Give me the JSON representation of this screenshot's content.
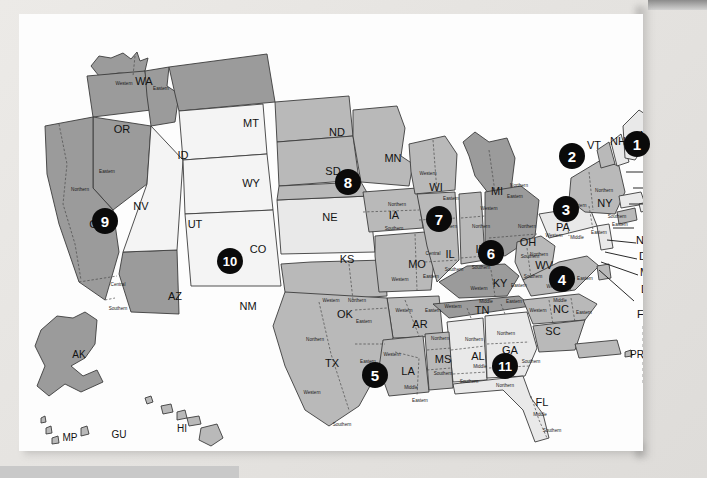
{
  "document": {
    "type": "map",
    "title": "United States Federal Judicial Circuits and District Courts Map",
    "background_color": "#e8e8e6",
    "paper_color": "#fdfdfd"
  },
  "legend_colors": {
    "circuit_dark": "#9b9b9b",
    "circuit_mid": "#b9b9b9",
    "circuit_light": "#e9e9e9",
    "circuit_white": "#f4f4f4",
    "badge_fill": "#0a0a0a",
    "badge_text": "#ffffff",
    "outline": "#3c3c3c"
  },
  "circuits": [
    {
      "number": "1",
      "x": 637,
      "y": 144,
      "size": 26
    },
    {
      "number": "2",
      "x": 572,
      "y": 156,
      "size": 26
    },
    {
      "number": "3",
      "x": 566,
      "y": 209,
      "size": 26
    },
    {
      "number": "4",
      "x": 562,
      "y": 279,
      "size": 26
    },
    {
      "number": "5",
      "x": 375,
      "y": 375,
      "size": 26
    },
    {
      "number": "6",
      "x": 491,
      "y": 253,
      "size": 26
    },
    {
      "number": "7",
      "x": 439,
      "y": 219,
      "size": 26
    },
    {
      "number": "8",
      "x": 348,
      "y": 182,
      "size": 26
    },
    {
      "number": "9",
      "x": 105,
      "y": 221,
      "size": 26
    },
    {
      "number": "10",
      "x": 230,
      "y": 261,
      "size": 26
    },
    {
      "number": "11",
      "x": 505,
      "y": 366,
      "size": 26
    }
  ],
  "states": [
    {
      "code": "WA",
      "x": 125,
      "y": 68,
      "group": "circuit9"
    },
    {
      "code": "OR",
      "x": 103,
      "y": 116,
      "group": "circuit9"
    },
    {
      "code": "ID",
      "x": 164,
      "y": 142,
      "group": "circuit9"
    },
    {
      "code": "MT",
      "x": 232,
      "y": 110,
      "group": "circuit9"
    },
    {
      "code": "ND",
      "x": 318,
      "y": 119,
      "group": "circuit8"
    },
    {
      "code": "SD",
      "x": 314,
      "y": 158,
      "group": "circuit8"
    },
    {
      "code": "NE",
      "x": 311,
      "y": 204,
      "group": "circuit8"
    },
    {
      "code": "MN",
      "x": 374,
      "y": 145,
      "group": "circuit8"
    },
    {
      "code": "WY",
      "x": 232,
      "y": 170,
      "group": "circuit10"
    },
    {
      "code": "NV",
      "x": 122,
      "y": 193,
      "group": "circuit9"
    },
    {
      "code": "CA",
      "x": 78,
      "y": 211,
      "group": "circuit9"
    },
    {
      "code": "UT",
      "x": 176,
      "y": 211,
      "group": "circuit10"
    },
    {
      "code": "CO",
      "x": 239,
      "y": 236,
      "group": "circuit10"
    },
    {
      "code": "KS",
      "x": 328,
      "y": 246,
      "group": "circuit10"
    },
    {
      "code": "AZ",
      "x": 156,
      "y": 283,
      "group": "circuit9"
    },
    {
      "code": "NM",
      "x": 229,
      "y": 293,
      "group": "circuit10"
    },
    {
      "code": "OK",
      "x": 326,
      "y": 301,
      "group": "circuit10"
    },
    {
      "code": "TX",
      "x": 313,
      "y": 350,
      "group": "circuit5"
    },
    {
      "code": "IA",
      "x": 375,
      "y": 202,
      "group": "circuit8"
    },
    {
      "code": "MO",
      "x": 398,
      "y": 251,
      "group": "circuit8"
    },
    {
      "code": "AR",
      "x": 401,
      "y": 311,
      "group": "circuit8"
    },
    {
      "code": "LA",
      "x": 389,
      "y": 358,
      "group": "circuit5"
    },
    {
      "code": "MS",
      "x": 424,
      "y": 346,
      "group": "circuit5"
    },
    {
      "code": "WI",
      "x": 417,
      "y": 174,
      "group": "circuit7"
    },
    {
      "code": "IL",
      "x": 431,
      "y": 241,
      "group": "circuit7"
    },
    {
      "code": "IN",
      "x": 462,
      "y": 236,
      "group": "circuit7"
    },
    {
      "code": "MI",
      "x": 478,
      "y": 178,
      "group": "circuit6"
    },
    {
      "code": "OH",
      "x": 509,
      "y": 229,
      "group": "circuit6"
    },
    {
      "code": "KY",
      "x": 481,
      "y": 270,
      "group": "circuit6"
    },
    {
      "code": "TN",
      "x": 463,
      "y": 297,
      "group": "circuit6"
    },
    {
      "code": "AL",
      "x": 459,
      "y": 343,
      "group": "circuit11"
    },
    {
      "code": "GA",
      "x": 491,
      "y": 337,
      "group": "circuit11"
    },
    {
      "code": "FL",
      "x": 523,
      "y": 389,
      "group": "circuit11"
    },
    {
      "code": "SC",
      "x": 534,
      "y": 318,
      "group": "circuit4"
    },
    {
      "code": "NC",
      "x": 542,
      "y": 296,
      "group": "circuit4"
    },
    {
      "code": "VA",
      "x": 549,
      "y": 262,
      "group": "circuit4"
    },
    {
      "code": "WV",
      "x": 525,
      "y": 252,
      "group": "circuit4"
    },
    {
      "code": "PA",
      "x": 544,
      "y": 214,
      "group": "circuit3"
    },
    {
      "code": "NY",
      "x": 586,
      "y": 190,
      "group": "circuit2"
    },
    {
      "code": "VT",
      "x": 575,
      "y": 132,
      "group": "circuit2"
    },
    {
      "code": "NH",
      "x": 599,
      "y": 128,
      "group": "circuit1"
    },
    {
      "code": "ME",
      "x": 629,
      "y": 122,
      "group": "circuit1"
    }
  ],
  "callout_labels": [
    {
      "code": "MA",
      "x": 626,
      "y": 172
    },
    {
      "code": "RI",
      "x": 633,
      "y": 188
    },
    {
      "code": "CT",
      "x": 633,
      "y": 205
    },
    {
      "code": "NJ",
      "x": 617,
      "y": 227
    },
    {
      "code": "DE",
      "x": 620,
      "y": 243
    },
    {
      "code": "MD",
      "x": 621,
      "y": 259
    },
    {
      "code": "DC",
      "x": 622,
      "y": 276
    },
    {
      "code": "FED",
      "x": 618,
      "y": 301
    }
  ],
  "territories": [
    {
      "code": "AK",
      "x": 60,
      "y": 341
    },
    {
      "code": "HI",
      "x": 163,
      "y": 415
    },
    {
      "code": "MP",
      "x": 51,
      "y": 424
    },
    {
      "code": "GU",
      "x": 100,
      "y": 421
    },
    {
      "code": "PR",
      "x": 618,
      "y": 341
    },
    {
      "code": "VI",
      "x": 674,
      "y": 356
    }
  ],
  "district_divisions": [
    {
      "name": "Western",
      "state": "WA",
      "x": 105,
      "y": 70
    },
    {
      "name": "Eastern",
      "state": "WA",
      "x": 142,
      "y": 75
    },
    {
      "name": "Eastern",
      "state": "CA",
      "x": 88,
      "y": 158
    },
    {
      "name": "Northern",
      "state": "CA",
      "x": 61,
      "y": 176
    },
    {
      "name": "Central",
      "state": "CA",
      "x": 99,
      "y": 271
    },
    {
      "name": "Southern",
      "state": "CA",
      "x": 99,
      "y": 295
    },
    {
      "name": "Northern",
      "state": "IA",
      "x": 378,
      "y": 191
    },
    {
      "name": "Southern",
      "state": "IA",
      "x": 375,
      "y": 215
    },
    {
      "name": "Western",
      "state": "WI",
      "x": 409,
      "y": 160
    },
    {
      "name": "Eastern",
      "state": "WI",
      "x": 432,
      "y": 185
    },
    {
      "name": "Western",
      "state": "MI",
      "x": 470,
      "y": 195
    },
    {
      "name": "Eastern",
      "state": "MI",
      "x": 496,
      "y": 183
    },
    {
      "name": "Northern",
      "state": "IL",
      "x": 429,
      "y": 213
    },
    {
      "name": "Central",
      "state": "IL",
      "x": 414,
      "y": 240
    },
    {
      "name": "Southern",
      "state": "IL",
      "x": 435,
      "y": 256
    },
    {
      "name": "Northern",
      "state": "IN",
      "x": 462,
      "y": 213
    },
    {
      "name": "Southern",
      "state": "IN",
      "x": 462,
      "y": 254
    },
    {
      "name": "Northern",
      "state": "OH",
      "x": 508,
      "y": 213
    },
    {
      "name": "Southern",
      "state": "OH",
      "x": 511,
      "y": 243
    },
    {
      "name": "Western",
      "state": "MO",
      "x": 381,
      "y": 266
    },
    {
      "name": "Eastern",
      "state": "MO",
      "x": 412,
      "y": 263
    },
    {
      "name": "Western",
      "state": "AR",
      "x": 385,
      "y": 297
    },
    {
      "name": "Eastern",
      "state": "AR",
      "x": 414,
      "y": 297
    },
    {
      "name": "Western",
      "state": "OK",
      "x": 312,
      "y": 287
    },
    {
      "name": "Northern",
      "state": "OK",
      "x": 338,
      "y": 287
    },
    {
      "name": "Eastern",
      "state": "OK",
      "x": 345,
      "y": 308
    },
    {
      "name": "Northern",
      "state": "TX",
      "x": 296,
      "y": 326
    },
    {
      "name": "Eastern",
      "state": "TX",
      "x": 349,
      "y": 348
    },
    {
      "name": "Western",
      "state": "TX",
      "x": 293,
      "y": 379
    },
    {
      "name": "Southern",
      "state": "TX",
      "x": 323,
      "y": 411
    },
    {
      "name": "Western",
      "state": "LA",
      "x": 373,
      "y": 341
    },
    {
      "name": "Middle",
      "state": "LA",
      "x": 392,
      "y": 374
    },
    {
      "name": "Eastern",
      "state": "LA",
      "x": 401,
      "y": 387
    },
    {
      "name": "Northern",
      "state": "MS",
      "x": 421,
      "y": 325
    },
    {
      "name": "Southern",
      "state": "MS",
      "x": 424,
      "y": 360
    },
    {
      "name": "Northern",
      "state": "AL",
      "x": 455,
      "y": 326
    },
    {
      "name": "Middle",
      "state": "AL",
      "x": 461,
      "y": 353
    },
    {
      "name": "Southern",
      "state": "AL",
      "x": 450,
      "y": 368
    },
    {
      "name": "Northern",
      "state": "GA",
      "x": 487,
      "y": 320
    },
    {
      "name": "Middle",
      "state": "GA",
      "x": 485,
      "y": 347
    },
    {
      "name": "Southern",
      "state": "GA",
      "x": 512,
      "y": 348
    },
    {
      "name": "Northern",
      "state": "FL",
      "x": 486,
      "y": 372
    },
    {
      "name": "Middle",
      "state": "FL",
      "x": 521,
      "y": 401
    },
    {
      "name": "Southern",
      "state": "FL",
      "x": 533,
      "y": 417
    },
    {
      "name": "Western",
      "state": "KY",
      "x": 460,
      "y": 275
    },
    {
      "name": "Eastern",
      "state": "KY",
      "x": 500,
      "y": 272
    },
    {
      "name": "Western",
      "state": "TN",
      "x": 434,
      "y": 293
    },
    {
      "name": "Middle",
      "state": "TN",
      "x": 467,
      "y": 288
    },
    {
      "name": "Eastern",
      "state": "TN",
      "x": 495,
      "y": 288
    },
    {
      "name": "Northern",
      "state": "WV",
      "x": 520,
      "y": 241
    },
    {
      "name": "Southern",
      "state": "WV",
      "x": 514,
      "y": 263
    },
    {
      "name": "Western",
      "state": "VA",
      "x": 536,
      "y": 273
    },
    {
      "name": "Eastern",
      "state": "VA",
      "x": 566,
      "y": 265
    },
    {
      "name": "Western",
      "state": "NC",
      "x": 519,
      "y": 297
    },
    {
      "name": "Middle",
      "state": "NC",
      "x": 541,
      "y": 287
    },
    {
      "name": "Eastern",
      "state": "NC",
      "x": 565,
      "y": 299
    },
    {
      "name": "Western",
      "state": "PA",
      "x": 535,
      "y": 222
    },
    {
      "name": "Middle",
      "state": "PA",
      "x": 558,
      "y": 224
    },
    {
      "name": "Eastern",
      "state": "PA",
      "x": 580,
      "y": 219
    },
    {
      "name": "Northern",
      "state": "NY",
      "x": 585,
      "y": 177
    },
    {
      "name": "Western",
      "state": "NY",
      "x": 559,
      "y": 192
    },
    {
      "name": "Southern",
      "state": "NY",
      "x": 598,
      "y": 203
    },
    {
      "name": "Eastern",
      "state": "NY",
      "x": 601,
      "y": 211
    },
    {
      "name": "Northern",
      "state": "GA2",
      "x": 500,
      "y": 172
    }
  ]
}
